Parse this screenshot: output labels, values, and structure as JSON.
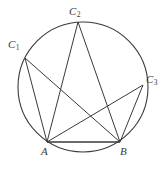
{
  "figure": {
    "type": "geometry-diagram",
    "width": 167,
    "height": 170,
    "stroke_color": "#3a3a3a",
    "background_color": "#ffffff",
    "stroke_width": 1,
    "circle": {
      "center_x": 83,
      "center_y": 87,
      "radius": 65
    },
    "points": [
      {
        "id": "C1",
        "letter": "C",
        "subscript": "1",
        "x": 25,
        "y": 58
      },
      {
        "id": "C2",
        "letter": "C",
        "subscript": "2",
        "x": 78,
        "y": 22
      },
      {
        "id": "C3",
        "letter": "C",
        "subscript": "3",
        "x": 143,
        "y": 85
      },
      {
        "id": "A",
        "letter": "A",
        "subscript": "",
        "x": 47,
        "y": 142
      },
      {
        "id": "B",
        "letter": "B",
        "subscript": "",
        "x": 120,
        "y": 142
      }
    ],
    "segments": [
      {
        "from": "A",
        "to": "B"
      },
      {
        "from": "A",
        "to": "C1"
      },
      {
        "from": "A",
        "to": "C2"
      },
      {
        "from": "A",
        "to": "C3"
      },
      {
        "from": "B",
        "to": "C1"
      },
      {
        "from": "B",
        "to": "C2"
      },
      {
        "from": "B",
        "to": "C3"
      }
    ],
    "labels": {
      "C1": "C",
      "C1_sub": "1",
      "C2": "C",
      "C2_sub": "2",
      "C3": "C",
      "C3_sub": "3",
      "A": "A",
      "B": "B"
    }
  }
}
